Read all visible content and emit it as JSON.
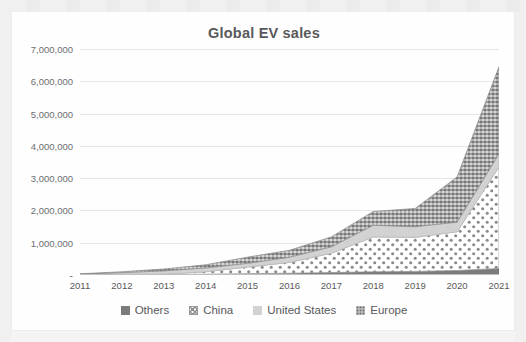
{
  "chart_data": {
    "type": "area",
    "title": "Global EV sales",
    "xlabel": "",
    "ylabel": "",
    "stacked": true,
    "grid": true,
    "legend_position": "bottom",
    "ylim": [
      0,
      7000000
    ],
    "ytick_values": [
      0,
      1000000,
      2000000,
      3000000,
      4000000,
      5000000,
      6000000,
      7000000
    ],
    "ytick_labels": [
      "-",
      "1,000,000",
      "2,000,000",
      "3,000,000",
      "4,000,000",
      "5,000,000",
      "6,000,000",
      "7,000,000"
    ],
    "categories": [
      "2011",
      "2012",
      "2013",
      "2014",
      "2015",
      "2016",
      "2017",
      "2018",
      "2019",
      "2020",
      "2021"
    ],
    "series": [
      {
        "name": "Others",
        "color": "#7b7b7b",
        "pattern": "solid",
        "values": [
          3000,
          8000,
          15000,
          25000,
          40000,
          55000,
          75000,
          100000,
          110000,
          140000,
          200000
        ]
      },
      {
        "name": "China",
        "color": "#ffffff",
        "pattern": "dotted-grid",
        "values": [
          5000,
          11000,
          15000,
          75000,
          207000,
          336000,
          600000,
          1080000,
          1060000,
          1200000,
          3150000
        ]
      },
      {
        "name": "United States",
        "color": "#d2d2d2",
        "pattern": "solid",
        "values": [
          17000,
          53000,
          97000,
          119000,
          114000,
          159000,
          198000,
          361000,
          327000,
          296000,
          400000
        ]
      },
      {
        "name": "Europe",
        "color": "#9c9c9c",
        "pattern": "speckled",
        "values": [
          12000,
          28000,
          58000,
          97000,
          192000,
          215000,
          307000,
          425000,
          564000,
          1400000,
          2700000
        ]
      }
    ],
    "totals": [
      37000,
      100000,
      185000,
      316000,
      553000,
      765000,
      1180000,
      1966000,
      2061000,
      3036000,
      6450000
    ]
  }
}
